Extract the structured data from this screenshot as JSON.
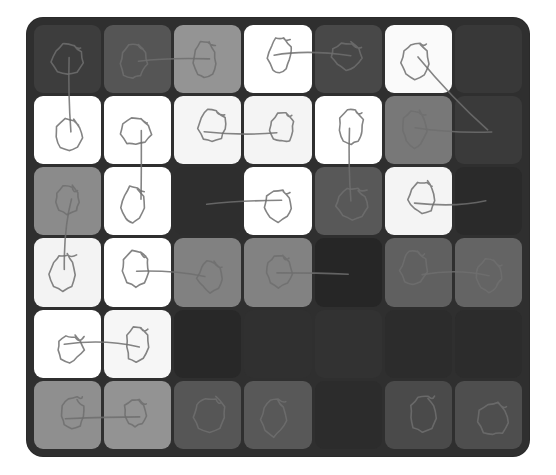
{
  "board": {
    "name": "grid-heatmap-board",
    "frame_color": "#2f2f2f",
    "rows": 6,
    "cols": 7,
    "cell_radius_px": 9
  },
  "palette": {
    "near_black": "#262626",
    "very_dark": "#2e2e2e",
    "dark": "#3d3d3d",
    "dark_mid": "#474747",
    "mid_dark": "#555555",
    "mid": "#6b6b6b",
    "mid_light": "#808080",
    "light": "#8f8f8f",
    "lighter": "#949494",
    "pale": "#a8a8a8",
    "near_white": "#f4f4f4",
    "white": "#ffffff",
    "ink": "#6f6f6f"
  },
  "chart_data": {
    "type": "heatmap",
    "title": "",
    "xlabel": "",
    "ylabel": "",
    "grid": true,
    "legend": "none",
    "rows": 6,
    "cols": 7,
    "row_labels": [
      "r1",
      "r2",
      "r3",
      "r4",
      "r5",
      "r6"
    ],
    "col_labels": [
      "c1",
      "c2",
      "c3",
      "c4",
      "c5",
      "c6",
      "c7"
    ],
    "value_range": [
      0,
      255
    ],
    "note": "values are 8-bit gray levels read from each tile",
    "values": [
      [
        61,
        85,
        148,
        255,
        72,
        250,
        56
      ],
      [
        255,
        255,
        245,
        244,
        255,
        120,
        58
      ],
      [
        139,
        255,
        46,
        255,
        88,
        244,
        42
      ],
      [
        243,
        255,
        129,
        130,
        38,
        96,
        100
      ],
      [
        255,
        246,
        40,
        48,
        50,
        44,
        44
      ],
      [
        143,
        147,
        86,
        88,
        44,
        74,
        78
      ]
    ],
    "colors": [
      [
        "#3d3d3d",
        "#555555",
        "#949494",
        "#ffffff",
        "#484848",
        "#fafafa",
        "#383838"
      ],
      [
        "#ffffff",
        "#ffffff",
        "#f5f5f5",
        "#f4f4f4",
        "#ffffff",
        "#787878",
        "#3a3a3a"
      ],
      [
        "#8b8b8b",
        "#ffffff",
        "#2e2e2e",
        "#ffffff",
        "#585858",
        "#f4f4f4",
        "#2a2a2a"
      ],
      [
        "#f3f3f3",
        "#ffffff",
        "#818181",
        "#828282",
        "#262626",
        "#606060",
        "#646464"
      ],
      [
        "#ffffff",
        "#f6f6f6",
        "#282828",
        "#303030",
        "#323232",
        "#2c2c2c",
        "#2c2c2c"
      ],
      [
        "#8f8f8f",
        "#939393",
        "#565656",
        "#585858",
        "#2c2c2c",
        "#4a4a4a",
        "#4e4e4e"
      ]
    ]
  },
  "annotations": {
    "style": "hand-drawn-pencil",
    "stroke_color": "#6f6f6f",
    "description": "freehand loops inside tiles joined by freehand connector strokes",
    "marks": [
      {
        "id": "m-r1c1",
        "cell": [
          0,
          0
        ],
        "kind": "loop"
      },
      {
        "id": "m-r1c2",
        "cell": [
          0,
          1
        ],
        "kind": "loop"
      },
      {
        "id": "m-r1c3",
        "cell": [
          0,
          2
        ],
        "kind": "loop"
      },
      {
        "id": "m-r1c4",
        "cell": [
          0,
          3
        ],
        "kind": "loop"
      },
      {
        "id": "m-r1c5",
        "cell": [
          0,
          4
        ],
        "kind": "loop"
      },
      {
        "id": "m-r1c6",
        "cell": [
          0,
          5
        ],
        "kind": "loop"
      },
      {
        "id": "m-r2c1",
        "cell": [
          1,
          0
        ],
        "kind": "loop"
      },
      {
        "id": "m-r2c2",
        "cell": [
          1,
          1
        ],
        "kind": "loop"
      },
      {
        "id": "m-r2c3",
        "cell": [
          1,
          2
        ],
        "kind": "loop"
      },
      {
        "id": "m-r2c4",
        "cell": [
          1,
          3
        ],
        "kind": "loop"
      },
      {
        "id": "m-r2c5",
        "cell": [
          1,
          4
        ],
        "kind": "loop"
      },
      {
        "id": "m-r2c6",
        "cell": [
          1,
          5
        ],
        "kind": "loop"
      },
      {
        "id": "m-r3c1",
        "cell": [
          2,
          0
        ],
        "kind": "loop"
      },
      {
        "id": "m-r3c2",
        "cell": [
          2,
          1
        ],
        "kind": "loop"
      },
      {
        "id": "m-r3c4",
        "cell": [
          2,
          3
        ],
        "kind": "loop"
      },
      {
        "id": "m-r3c5",
        "cell": [
          2,
          4
        ],
        "kind": "loop"
      },
      {
        "id": "m-r3c6",
        "cell": [
          2,
          5
        ],
        "kind": "loop"
      },
      {
        "id": "m-r4c1",
        "cell": [
          3,
          0
        ],
        "kind": "loop"
      },
      {
        "id": "m-r4c2",
        "cell": [
          3,
          1
        ],
        "kind": "loop"
      },
      {
        "id": "m-r4c3",
        "cell": [
          3,
          2
        ],
        "kind": "loop"
      },
      {
        "id": "m-r4c4",
        "cell": [
          3,
          3
        ],
        "kind": "loop"
      },
      {
        "id": "m-r4c6",
        "cell": [
          3,
          5
        ],
        "kind": "loop"
      },
      {
        "id": "m-r4c7",
        "cell": [
          3,
          6
        ],
        "kind": "loop"
      },
      {
        "id": "m-r5c1",
        "cell": [
          4,
          0
        ],
        "kind": "loop"
      },
      {
        "id": "m-r5c2",
        "cell": [
          4,
          1
        ],
        "kind": "loop"
      },
      {
        "id": "m-r6c1",
        "cell": [
          5,
          0
        ],
        "kind": "loop"
      },
      {
        "id": "m-r6c2",
        "cell": [
          5,
          1
        ],
        "kind": "loop"
      },
      {
        "id": "m-r6c3",
        "cell": [
          5,
          2
        ],
        "kind": "loop"
      },
      {
        "id": "m-r6c4",
        "cell": [
          5,
          3
        ],
        "kind": "loop"
      },
      {
        "id": "m-r6c6",
        "cell": [
          5,
          5
        ],
        "kind": "loop"
      },
      {
        "id": "m-r6c7",
        "cell": [
          5,
          6
        ],
        "kind": "loop"
      }
    ],
    "connectors": [
      {
        "id": "c-r1c2-r1c3",
        "from": [
          0,
          1
        ],
        "to": [
          0,
          2
        ]
      },
      {
        "id": "c-r1c4-r1c5",
        "from": [
          0,
          3
        ],
        "to": [
          0,
          4
        ]
      },
      {
        "id": "c-r1c6-r2c7",
        "from": [
          0,
          5
        ],
        "to": [
          1,
          6
        ]
      },
      {
        "id": "c-r1c1-r2c1",
        "from": [
          0,
          0
        ],
        "to": [
          1,
          0
        ]
      },
      {
        "id": "c-r2c3-r2c4",
        "from": [
          1,
          2
        ],
        "to": [
          1,
          3
        ]
      },
      {
        "id": "c-r2c2-r3c2",
        "from": [
          1,
          1
        ],
        "to": [
          2,
          1
        ]
      },
      {
        "id": "c-r2c5-r3c5",
        "from": [
          1,
          4
        ],
        "to": [
          2,
          4
        ]
      },
      {
        "id": "c-r2c6-r2c7",
        "from": [
          1,
          5
        ],
        "to": [
          1,
          6
        ]
      },
      {
        "id": "c-r3c3-r3c4",
        "from": [
          2,
          2
        ],
        "to": [
          2,
          3
        ]
      },
      {
        "id": "c-r3c6-r3c7",
        "from": [
          2,
          5
        ],
        "to": [
          2,
          6
        ]
      },
      {
        "id": "c-r3c1-r4c1",
        "from": [
          2,
          0
        ],
        "to": [
          3,
          0
        ]
      },
      {
        "id": "c-r4c2-r4c3",
        "from": [
          3,
          1
        ],
        "to": [
          3,
          2
        ]
      },
      {
        "id": "c-r4c4-r4c5",
        "from": [
          3,
          3
        ],
        "to": [
          3,
          4
        ]
      },
      {
        "id": "c-r4c6-r4c7",
        "from": [
          3,
          5
        ],
        "to": [
          3,
          6
        ]
      },
      {
        "id": "c-r5c1-r5c2",
        "from": [
          4,
          0
        ],
        "to": [
          4,
          1
        ]
      },
      {
        "id": "c-r6c1-r6c2",
        "from": [
          5,
          0
        ],
        "to": [
          5,
          1
        ]
      }
    ]
  }
}
